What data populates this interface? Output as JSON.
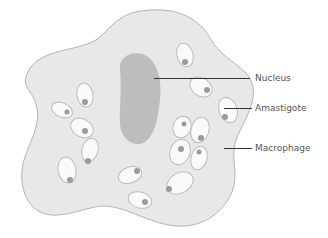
{
  "title": "",
  "labels": [
    {
      "id": "nucleus",
      "text": "Nucleus"
    },
    {
      "id": "amastigote",
      "text": "Amastigote"
    },
    {
      "id": "macrophage",
      "text": "Macrophage"
    }
  ],
  "colors": {
    "cytoplasm": "#e8e8e8",
    "cell_outline": "#b3b3b3",
    "nucleus": "#bdbdbd",
    "amastigote_body": "#fafafa",
    "amastigote_outline": "#bcbcbc",
    "kinetoplast_dot": "#9a9a9a",
    "leader_line": "#333333",
    "label_text": "#555555"
  }
}
